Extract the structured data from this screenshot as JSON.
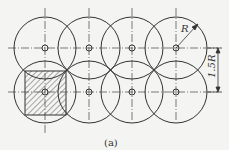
{
  "figure": {
    "caption": "(a)",
    "radius_label": "R",
    "spacing_label": "1.5R"
  },
  "geometry": {
    "columns_x": [
      45,
      89,
      132,
      176
    ],
    "rows_y": [
      48,
      92
    ],
    "radius": 31,
    "stroke": "#333333",
    "hatch_color": "#555555"
  }
}
